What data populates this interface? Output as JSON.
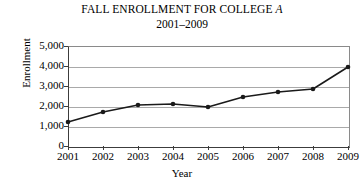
{
  "chart_data": {
    "type": "line",
    "title": "FALL ENROLLMENT FOR COLLEGE A",
    "title_plain": "FALL ENROLLMENT FOR COLLEGE ",
    "title_italic_suffix": "A",
    "subtitle": "2001–2009",
    "xlabel": "Year",
    "ylabel": "Enrollment",
    "categories": [
      "2001",
      "2002",
      "2003",
      "2004",
      "2005",
      "2006",
      "2007",
      "2008",
      "2009"
    ],
    "x": [
      2001,
      2002,
      2003,
      2004,
      2005,
      2006,
      2007,
      2008,
      2009
    ],
    "values": [
      1200,
      1700,
      2050,
      2100,
      1950,
      2450,
      2700,
      2850,
      3950
    ],
    "series": [
      {
        "name": "Enrollment",
        "values": [
          1200,
          1700,
          2050,
          2100,
          1950,
          2450,
          2700,
          2850,
          3950
        ]
      }
    ],
    "ylim": [
      0,
      5000
    ],
    "xlim": [
      2001,
      2009
    ],
    "ytick_labels": [
      "5,000",
      "4,000",
      "3,000",
      "2,000",
      "1,000",
      "0"
    ],
    "ytick_values": [
      5000,
      4000,
      3000,
      2000,
      1000,
      0
    ],
    "grid": true,
    "grid_axis": "y",
    "legend": false,
    "legend_position": "none",
    "marker": "filled-circle",
    "line_color": "#1a1a1a",
    "marker_color": "#1a1a1a",
    "grid_color": "#a9a9a9",
    "axis_color": "#3c3c3c",
    "background_color": "#ffffff"
  }
}
